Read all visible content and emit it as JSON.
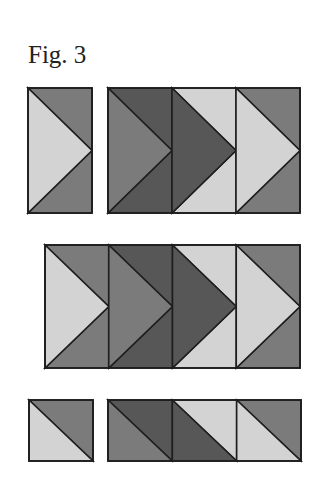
{
  "title": "Fig. 3",
  "colors": {
    "light": "#d3d3d3",
    "mid": "#7b7b7b",
    "dark": "#575757",
    "stroke": "#1e1e1e"
  },
  "rows": [
    {
      "name": "row-1",
      "blocks": [
        {
          "x": 28,
          "y": 88,
          "w": 64,
          "h": 125,
          "cells": [
            {
              "type": "arrow",
              "arrow": "light",
              "top": "mid",
              "bottom": "mid"
            }
          ]
        },
        {
          "x": 108,
          "y": 88,
          "w": 192,
          "h": 125,
          "cells": [
            {
              "type": "arrow",
              "arrow": "mid",
              "top": "dark",
              "bottom": "dark"
            },
            {
              "type": "arrow",
              "arrow": "dark",
              "top": "light",
              "bottom": "light"
            },
            {
              "type": "arrow",
              "arrow": "light",
              "top": "mid",
              "bottom": "mid"
            }
          ]
        }
      ]
    },
    {
      "name": "row-2",
      "blocks": [
        {
          "x": 45,
          "y": 245,
          "w": 255,
          "h": 123,
          "cells": [
            {
              "type": "arrow",
              "arrow": "light",
              "top": "mid",
              "bottom": "mid"
            },
            {
              "type": "arrow",
              "arrow": "mid",
              "top": "dark",
              "bottom": "dark"
            },
            {
              "type": "arrow",
              "arrow": "dark",
              "top": "light",
              "bottom": "light"
            },
            {
              "type": "arrow",
              "arrow": "light",
              "top": "mid",
              "bottom": "mid"
            }
          ]
        }
      ]
    },
    {
      "name": "row-3",
      "blocks": [
        {
          "x": 29,
          "y": 400,
          "w": 64,
          "h": 61,
          "cells": [
            {
              "type": "diag",
              "lower": "light",
              "upper": "mid"
            }
          ]
        },
        {
          "x": 108,
          "y": 400,
          "w": 193,
          "h": 61,
          "cells": [
            {
              "type": "diag",
              "lower": "mid",
              "upper": "dark"
            },
            {
              "type": "diag",
              "lower": "dark",
              "upper": "light"
            },
            {
              "type": "diag",
              "lower": "light",
              "upper": "mid"
            }
          ]
        }
      ]
    }
  ]
}
